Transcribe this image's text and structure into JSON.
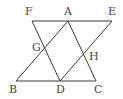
{
  "diagram": {
    "type": "geometry",
    "stroke_color": "#3a3a3a",
    "label_color": "#444444",
    "points": {
      "F": {
        "label": "F",
        "x": 32,
        "y": 21,
        "lx": 25,
        "ly": 15
      },
      "A": {
        "label": "A",
        "x": 68,
        "y": 21,
        "lx": 64,
        "ly": 15
      },
      "E": {
        "label": "E",
        "x": 112,
        "y": 21,
        "lx": 108,
        "ly": 15
      },
      "G": {
        "label": "G",
        "x": 45,
        "y": 48,
        "lx": 32,
        "ly": 51
      },
      "H": {
        "label": "H",
        "x": 83,
        "y": 54,
        "lx": 89,
        "ly": 60
      },
      "B": {
        "label": "B",
        "x": 16,
        "y": 81,
        "lx": 9,
        "ly": 93
      },
      "D": {
        "label": "D",
        "x": 60,
        "y": 81,
        "lx": 56,
        "ly": 93
      },
      "C": {
        "label": "C",
        "x": 96,
        "y": 81,
        "lx": 94,
        "ly": 93
      }
    },
    "segments": [
      {
        "name": "FE",
        "from": "F",
        "to": "E"
      },
      {
        "name": "BC",
        "from": "B",
        "to": "C"
      },
      {
        "name": "BA",
        "from": "B",
        "to": "A"
      },
      {
        "name": "FD",
        "from": "F",
        "to": "D"
      },
      {
        "name": "AC",
        "from": "A",
        "to": "C"
      },
      {
        "name": "DE",
        "from": "D",
        "to": "E"
      }
    ]
  }
}
